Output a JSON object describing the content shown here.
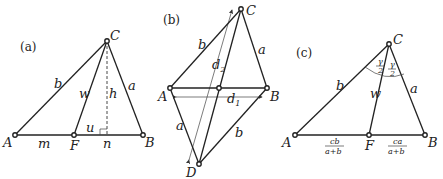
{
  "panels": [
    {
      "caption": "(a)",
      "vertices": {
        "A": "A",
        "B": "B",
        "C": "C",
        "F": "F"
      },
      "labels": {
        "b": "b",
        "a": "a",
        "w": "w",
        "h": "h",
        "u": "u",
        "m": "m",
        "n": "n"
      }
    },
    {
      "caption": "(b)",
      "vertices": {
        "A": "A",
        "B": "B",
        "C": "C",
        "D": "D"
      },
      "labels": {
        "b_top": "b",
        "a_top": "a",
        "a_bottom": "a",
        "b_bottom": "b",
        "d1": "d",
        "d1_sub": "1",
        "d2": "d",
        "d2_sub": "2"
      }
    },
    {
      "caption": "(c)",
      "vertices": {
        "A": "A",
        "B": "B",
        "C": "C",
        "F": "F"
      },
      "labels": {
        "b": "b",
        "a": "a",
        "w": "w",
        "angle_left_num": "γ",
        "angle_left_den": "2",
        "angle_right_num": "γ",
        "angle_right_den": "2",
        "seg_left_num": "cb",
        "seg_left_den": "a+b",
        "seg_right_num": "ca",
        "seg_right_den": "a+b"
      }
    }
  ]
}
